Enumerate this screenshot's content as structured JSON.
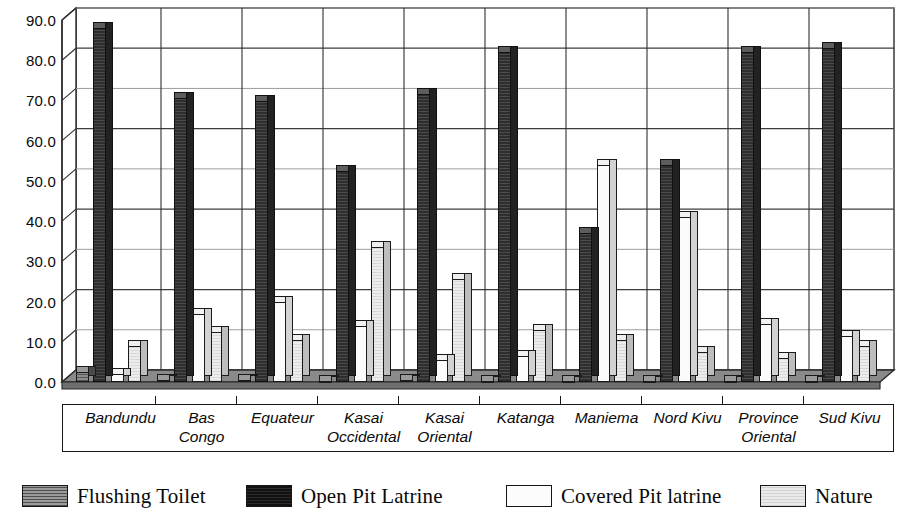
{
  "chart_data": {
    "type": "bar",
    "title": "",
    "subtitle": "",
    "xlabel": "",
    "ylabel": "",
    "ylim": [
      0,
      90
    ],
    "ytick_step": 10,
    "grid": true,
    "legend_position": "bottom",
    "style": "3d-clustered-column",
    "categories": [
      "Bandundu",
      "Bas\nCongo",
      "Equateur",
      "Kasai\nOccidental",
      "Kasai\nOriental",
      "Katanga",
      "Maniema",
      "Nord Kivu",
      "Province\nOriental",
      "Sud Kivu"
    ],
    "ytick_labels": [
      "0.0",
      "10.0",
      "20.0",
      "30.0",
      "40.0",
      "50.0",
      "60.0",
      "70.0",
      "80.0",
      "90.0"
    ],
    "ytick_values": [
      0,
      10,
      20,
      30,
      40,
      50,
      60,
      70,
      80,
      90
    ],
    "series": [
      {
        "name": "Flushing Toilet",
        "color": "#6e6e6e",
        "values": [
          2.5,
          0.4,
          0.6,
          0.3,
          0.4,
          0.3,
          0.3,
          0.3,
          0.3,
          0.3
        ]
      },
      {
        "name": "Open Pit Latrine",
        "color": "#2b2b2b",
        "values": [
          88.0,
          70.5,
          69.8,
          52.5,
          71.5,
          82.0,
          37.0,
          54.0,
          82.0,
          83.0
        ]
      },
      {
        "name": "Covered Pit latrine",
        "color": "#fbfbfb",
        "values": [
          2.0,
          17.0,
          20.0,
          14.0,
          5.5,
          6.5,
          54.0,
          41.0,
          14.5,
          11.5
        ]
      },
      {
        "name": "Nature",
        "color": "#e3e3e3",
        "values": [
          9.0,
          12.5,
          10.5,
          33.5,
          25.5,
          13.0,
          10.5,
          7.5,
          6.0,
          9.0
        ]
      }
    ]
  },
  "legend": {
    "items": [
      {
        "label": "Flushing Toilet",
        "swatch": "hatched-dark-gray"
      },
      {
        "label": "Open Pit Latrine",
        "swatch": "solid-black"
      },
      {
        "label": "Covered Pit latrine",
        "swatch": "white-outline"
      },
      {
        "label": "Nature",
        "swatch": "hatched-light-gray"
      }
    ]
  }
}
